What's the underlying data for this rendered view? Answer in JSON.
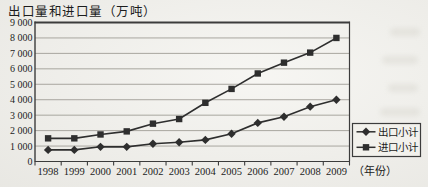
{
  "chart": {
    "title": "出口量和进口量（万吨）",
    "xlabel": "（年份）"
  },
  "chart_data": {
    "type": "line",
    "title": "出口量和进口量（万吨）",
    "categories": [
      "1998",
      "1999",
      "2000",
      "2001",
      "2002",
      "2003",
      "2004",
      "2005",
      "2006",
      "2007",
      "2008",
      "2009"
    ],
    "series": [
      {
        "name": "出口小计",
        "marker": "diamond",
        "values": [
          750,
          750,
          950,
          950,
          1150,
          1250,
          1400,
          1800,
          2500,
          2900,
          3550,
          4000
        ]
      },
      {
        "name": "进口小计",
        "marker": "square",
        "values": [
          1500,
          1500,
          1750,
          1950,
          2450,
          2750,
          3800,
          4700,
          5700,
          6400,
          7050,
          8000
        ]
      }
    ],
    "ylim": [
      0,
      9000
    ],
    "ytick_step": 1000,
    "ytick_labels": [
      "0",
      "1 000",
      "2 000",
      "3 000",
      "4 000",
      "5 000",
      "6 000",
      "7 000",
      "8 000",
      "9 000"
    ],
    "xlabel": "（年份）",
    "grid": "horizontal",
    "legend_position": "outside-bottom-right",
    "colors": {
      "line": "#2e2e2e",
      "grid": "#a8a69f",
      "border": "#3c3c3c",
      "background": "#f2f1ec",
      "text": "#1c1c1c"
    }
  }
}
